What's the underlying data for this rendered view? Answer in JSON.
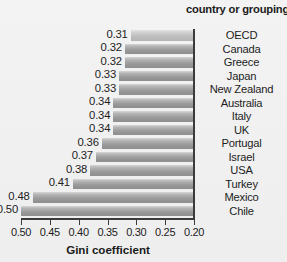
{
  "chart_data": {
    "type": "bar",
    "orientation": "horizontal",
    "title": "",
    "xlabel": "Gini coefficient",
    "ylabel": "",
    "category_header": "country or grouping",
    "xlim": [
      0.5,
      0.2
    ],
    "x_axis_reversed": true,
    "xticks": [
      "0.50",
      "0.45",
      "0.40",
      "0.35",
      "0.30",
      "0.25",
      "0.20"
    ],
    "xtick_values": [
      0.5,
      0.45,
      0.4,
      0.35,
      0.3,
      0.25,
      0.2
    ],
    "grid": false,
    "legend": false,
    "baseline": 0.2,
    "categories": [
      "OECD",
      "Canada",
      "Greece",
      "Japan",
      "New Zealand",
      "Australia",
      "Italy",
      "UK",
      "Portugal",
      "Israel",
      "USA",
      "Turkey",
      "Mexico",
      "Chile"
    ],
    "values": [
      0.31,
      0.32,
      0.32,
      0.33,
      0.33,
      0.34,
      0.34,
      0.34,
      0.36,
      0.37,
      0.38,
      0.41,
      0.48,
      0.5
    ],
    "value_labels": [
      "0.31",
      "0.32",
      "0.32",
      "0.33",
      "0.33",
      "0.34",
      "0.34",
      "0.34",
      "0.36",
      "0.37",
      "0.38",
      "0.41",
      "0.48",
      "0.50"
    ],
    "bar_style": [
      "pale",
      "normal",
      "normal",
      "normal",
      "normal",
      "normal",
      "normal",
      "normal",
      "normal",
      "normal",
      "normal",
      "normal",
      "normal",
      "normal"
    ],
    "colors": {
      "background": "#f1f1f1",
      "bar_light": "#d6d6d6",
      "bar_dark": "#8f8f8f",
      "axis": "#3b3b3b",
      "text": "#1d1d1d"
    }
  }
}
